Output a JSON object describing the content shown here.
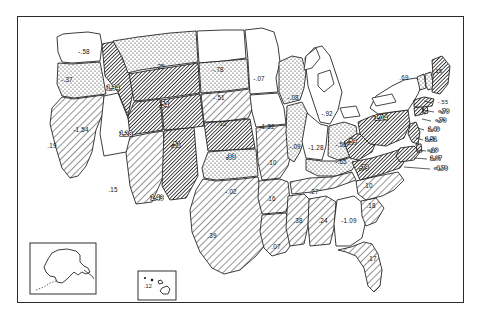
{
  "figure": {
    "title": "",
    "frame": true,
    "background_color": "#ffffff",
    "line_color": "#1a1a1a"
  },
  "legend": {
    "patterns": [
      {
        "key": "blank",
        "label": "blank",
        "fill": "#ffffff"
      },
      {
        "key": "dotted",
        "label": "stippled",
        "fill": "#f0f0f0"
      },
      {
        "key": "hatch-light",
        "label": "light diagonal",
        "fill": "#e6e6e6"
      },
      {
        "key": "hatch-dark",
        "label": "dense diagonal",
        "fill": "#9a9a9a"
      }
    ]
  },
  "insets": [
    {
      "name": "alaska-inset",
      "label": "-.80",
      "x": 30,
      "y": 243,
      "w": 66,
      "h": 51
    },
    {
      "name": "hawaii-inset",
      "label": ".12",
      "x": 138,
      "y": 271,
      "w": 38,
      "h": 29
    }
  ],
  "chart_data": {
    "type": "heatmap",
    "title": "",
    "xlabel": "",
    "ylabel": "",
    "subtitle": "",
    "legend_position": "none",
    "grid": false,
    "categories": [
      "WA",
      "OR",
      "CA",
      "NV",
      "ID",
      "MT",
      "WY",
      "UT",
      "AZ",
      "NM",
      "CO",
      "ND",
      "SD",
      "NE",
      "KS",
      "OK",
      "TX",
      "MN",
      "IA",
      "MO",
      "AR",
      "LA",
      "WI",
      "IL",
      "MI",
      "IN",
      "OH",
      "KY",
      "TN",
      "MS",
      "AL",
      "GA",
      "FL",
      "SC",
      "NC",
      "VA",
      "WV",
      "PA",
      "NY",
      "MD",
      "DE",
      "NJ",
      "CT",
      "RI",
      "MA",
      "VT",
      "NH",
      "ME",
      "AK",
      "HI"
    ],
    "values": [
      -0.58,
      -0.37,
      0.19,
      -1.54,
      1.34,
      -0.25,
      0.54,
      1.28,
      0.15,
      1.43,
      0.51,
      -0.78,
      -0.51,
      0.12,
      0.88,
      -0.02,
      0.39,
      -0.07,
      0.09,
      0.1,
      0.16,
      0.07,
      -0.08,
      -0.09,
      -0.92,
      -1.28,
      -0.56,
      -0.65,
      0.27,
      0.38,
      0.24,
      -1.09,
      0.17,
      0.18,
      0.1,
      0.79,
      0.59,
      1.04,
      0.69,
      1.07,
      -0.19,
      1.51,
      1.49,
      -0.73,
      -0.78,
      -0.15,
      -0.55,
      -4.78,
      -0.8,
      0.12
    ],
    "states": [
      {
        "code": "WA",
        "name": "Washington",
        "value": "-.58",
        "pattern": "blank",
        "lx": 84,
        "ly": 52
      },
      {
        "code": "OR",
        "name": "Oregon",
        "value": "-.37",
        "pattern": "dotted",
        "lx": 67,
        "ly": 80
      },
      {
        "code": "CA",
        "name": "California",
        "value": ".19",
        "pattern": "hatch-light",
        "lx": 52,
        "ly": 146
      },
      {
        "code": "NV",
        "name": "Nevada",
        "value": "-1.54",
        "pattern": "blank",
        "lx": 81,
        "ly": 130
      },
      {
        "code": "ID",
        "name": "Idaho",
        "value": "1.34",
        "pattern": "hatch-dark",
        "lx": 113,
        "ly": 88
      },
      {
        "code": "MT",
        "name": "Montana",
        "value": "-.25",
        "pattern": "dotted",
        "lx": 159,
        "ly": 67
      },
      {
        "code": "WY",
        "name": "Wyoming",
        "value": ".54",
        "pattern": "hatch-dark",
        "lx": 164,
        "ly": 105
      },
      {
        "code": "UT",
        "name": "Utah",
        "value": "1.28",
        "pattern": "hatch-dark",
        "lx": 126,
        "ly": 134
      },
      {
        "code": "AZ",
        "name": "Arizona",
        "value": ".15",
        "pattern": "hatch-light",
        "lx": 113,
        "ly": 190
      },
      {
        "code": "NM",
        "name": "New Mexico",
        "value": "1.43",
        "pattern": "hatch-dark",
        "lx": 157,
        "ly": 198
      },
      {
        "code": "CO",
        "name": "Colorado",
        "value": ".51",
        "pattern": "hatch-dark",
        "lx": 176,
        "ly": 145
      },
      {
        "code": "ND",
        "name": "North Dakota",
        "value": "-.78",
        "pattern": "blank",
        "lx": 218,
        "ly": 70
      },
      {
        "code": "SD",
        "name": "South Dakota",
        "value": "-.51",
        "pattern": "dotted",
        "lx": 219,
        "ly": 98
      },
      {
        "code": "NE",
        "name": "Nebraska",
        "value": ".12",
        "pattern": "hatch-light",
        "lx": 222,
        "ly": 124
      },
      {
        "code": "KS",
        "name": "Kansas",
        "value": ".88",
        "pattern": "hatch-dark",
        "lx": 231,
        "ly": 157
      },
      {
        "code": "OK",
        "name": "Oklahoma",
        "value": "-.02",
        "pattern": "dotted",
        "lx": 231,
        "ly": 192
      },
      {
        "code": "TX",
        "name": "Texas",
        "value": ".39",
        "pattern": "hatch-light",
        "lx": 212,
        "ly": 236
      },
      {
        "code": "MN",
        "name": "Minnesota",
        "value": "-.07",
        "pattern": "blank",
        "lx": 259,
        "ly": 79
      },
      {
        "code": "IA",
        "name": "Iowa",
        "value": "-1.32",
        "pattern": "blank",
        "lx": 267,
        "ly": 127
      },
      {
        "code": "MO",
        "name": "Missouri",
        "value": ".10",
        "pattern": "hatch-light",
        "lx": 272,
        "ly": 163
      },
      {
        "code": "AR",
        "name": "Arkansas",
        "value": ".16",
        "pattern": "hatch-light",
        "lx": 271,
        "ly": 199
      },
      {
        "code": "LA",
        "name": "Louisiana",
        "value": ".07",
        "pattern": "hatch-light",
        "lx": 276,
        "ly": 247
      },
      {
        "code": "WI",
        "name": "Wisconsin",
        "value": "-.08",
        "pattern": "dotted",
        "lx": 293,
        "ly": 98
      },
      {
        "code": "IL",
        "name": "Illinois",
        "value": "-.09",
        "pattern": "dotted",
        "lx": 295,
        "ly": 147
      },
      {
        "code": "MI",
        "name": "Michigan",
        "value": "-.92",
        "pattern": "blank",
        "lx": 327,
        "ly": 114
      },
      {
        "code": "IN",
        "name": "Indiana",
        "value": "-1.28",
        "pattern": "blank",
        "lx": 316,
        "ly": 148
      },
      {
        "code": "OH",
        "name": "Ohio",
        "value": "-.56",
        "pattern": "dotted",
        "lx": 341,
        "ly": 145
      },
      {
        "code": "KY",
        "name": "Kentucky",
        "value": "-.65",
        "pattern": "dotted",
        "lx": 341,
        "ly": 162
      },
      {
        "code": "TN",
        "name": "Tennessee",
        "value": ".27",
        "pattern": "hatch-light",
        "lx": 314,
        "ly": 192
      },
      {
        "code": "MS",
        "name": "Mississippi",
        "value": ".38",
        "pattern": "hatch-light",
        "lx": 298,
        "ly": 221
      },
      {
        "code": "AL",
        "name": "Alabama",
        "value": ".24",
        "pattern": "hatch-light",
        "lx": 323,
        "ly": 221
      },
      {
        "code": "GA",
        "name": "Georgia",
        "value": "-1.09",
        "pattern": "blank",
        "lx": 349,
        "ly": 221
      },
      {
        "code": "FL",
        "name": "Florida",
        "value": ".17",
        "pattern": "hatch-light",
        "lx": 372,
        "ly": 259
      },
      {
        "code": "SC",
        "name": "South Carolina",
        "value": ".18",
        "pattern": "hatch-light",
        "lx": 371,
        "ly": 206
      },
      {
        "code": "NC",
        "name": "North Carolina",
        "value": ".10",
        "pattern": "hatch-light",
        "lx": 368,
        "ly": 186
      },
      {
        "code": "VA",
        "name": "Virginia",
        "value": ".79",
        "pattern": "hatch-dark",
        "lx": 364,
        "ly": 168
      },
      {
        "code": "WV",
        "name": "West Virginia",
        "value": ".59",
        "pattern": "hatch-dark",
        "lx": 352,
        "ly": 142
      },
      {
        "code": "PA",
        "name": "Pennsylvania",
        "value": "1.04",
        "pattern": "hatch-dark",
        "lx": 381,
        "ly": 118
      },
      {
        "code": "NY",
        "name": "New York",
        "value": ".69",
        "pattern": "blank",
        "lx": 404,
        "ly": 78
      },
      {
        "code": "MD",
        "name": "Maryland",
        "value": "1.07",
        "pattern": "hatch-dark",
        "lx": 436,
        "ly": 159
      },
      {
        "code": "DE",
        "name": "Delaware",
        "value": "-.19",
        "pattern": "hatch-dark",
        "lx": 433,
        "ly": 151
      },
      {
        "code": "NJ",
        "name": "New Jersey",
        "value": "1.51",
        "pattern": "hatch-dark",
        "lx": 431,
        "ly": 140
      },
      {
        "code": "CT",
        "name": "Connecticut",
        "value": "1.49",
        "pattern": "hatch-dark",
        "lx": 434,
        "ly": 130
      },
      {
        "code": "RI",
        "name": "Rhode Island",
        "value": "-.73",
        "pattern": "hatch-dark",
        "lx": 441,
        "ly": 121
      },
      {
        "code": "MA",
        "name": "Massachusetts",
        "value": "-.78",
        "pattern": "hatch-dark",
        "lx": 444,
        "ly": 112
      },
      {
        "code": "VT",
        "name": "Vermont",
        "value": "-.15",
        "pattern": "dotted",
        "lx": 437,
        "ly": 72
      },
      {
        "code": "NH",
        "name": "New Hampshire",
        "value": "-.55",
        "pattern": "dotted",
        "lx": 443,
        "ly": 103
      },
      {
        "code": "ME",
        "name": "Maine",
        "value": "-4.78",
        "pattern": "hatch-dark",
        "lx": 441,
        "ly": 169
      },
      {
        "code": "AK",
        "name": "Alaska",
        "value": "-.80",
        "pattern": "blank",
        "lx": 63,
        "ly": 262
      },
      {
        "code": "HI",
        "name": "Hawaii",
        "value": ".12",
        "pattern": "blank",
        "lx": 148,
        "ly": 287
      }
    ]
  }
}
